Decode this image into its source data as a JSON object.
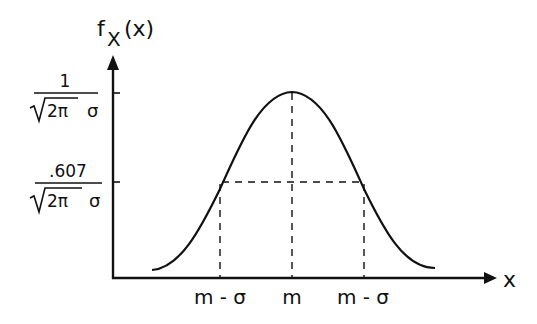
{
  "figure": {
    "type": "gaussian-density-sketch",
    "y_axis_label": "f",
    "y_axis_subscript": "X",
    "y_axis_arg": "(x)",
    "x_axis_label": "x",
    "y_ticks": [
      {
        "numerator": "1",
        "denominator_root": "2π",
        "denominator_tail": "σ"
      },
      {
        "numerator": ".607",
        "denominator_root": "2π",
        "denominator_tail": "σ"
      }
    ],
    "x_ticks": [
      "m - σ",
      "m",
      "m - σ"
    ]
  },
  "colors": {
    "ink": "#111111",
    "background": "#ffffff"
  }
}
